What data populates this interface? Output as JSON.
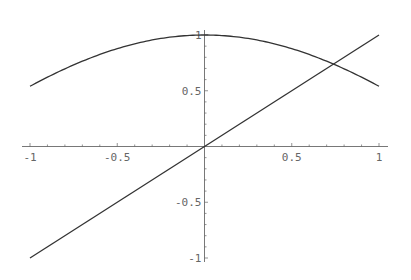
{
  "chart_data": {
    "type": "line",
    "title": "",
    "xlabel": "",
    "ylabel": "",
    "xlim": [
      -1,
      1
    ],
    "ylim": [
      -1,
      1
    ],
    "grid": false,
    "legend": null,
    "axes_origin": [
      0,
      0
    ],
    "x_major_ticks": [
      {
        "value": -1,
        "label": "-1"
      },
      {
        "value": -0.5,
        "label": "-0.5"
      },
      {
        "value": 0.5,
        "label": "0.5"
      },
      {
        "value": 1,
        "label": "1"
      }
    ],
    "y_major_ticks": [
      {
        "value": 1,
        "label": "1"
      },
      {
        "value": 0.5,
        "label": "0.5"
      },
      {
        "value": -0.5,
        "label": "-0.5"
      },
      {
        "value": -1,
        "label": "-1"
      }
    ],
    "minor_tick_step": 0.1,
    "series": [
      {
        "name": "cos(x)",
        "color": "#333333",
        "x": [
          -1,
          -0.9,
          -0.8,
          -0.7,
          -0.6,
          -0.5,
          -0.4,
          -0.3,
          -0.2,
          -0.1,
          0,
          0.1,
          0.2,
          0.3,
          0.4,
          0.5,
          0.6,
          0.7,
          0.8,
          0.9,
          1
        ],
        "values": [
          0.54,
          0.622,
          0.697,
          0.765,
          0.825,
          0.878,
          0.921,
          0.955,
          0.98,
          0.995,
          1.0,
          0.995,
          0.98,
          0.955,
          0.921,
          0.878,
          0.825,
          0.765,
          0.697,
          0.622,
          0.54
        ]
      },
      {
        "name": "x",
        "color": "#333333",
        "x": [
          -1,
          1
        ],
        "values": [
          -1,
          1
        ]
      }
    ],
    "annotations": [
      {
        "type": "intersection",
        "x": 0.739,
        "y": 0.739
      }
    ]
  },
  "layout": {
    "px_x_min": 30,
    "px_x_max": 379,
    "px_y_top": 35,
    "px_y_bottom": 258,
    "axis_x_extent": [
      22,
      388
    ],
    "axis_y_extent": [
      30,
      262
    ]
  }
}
